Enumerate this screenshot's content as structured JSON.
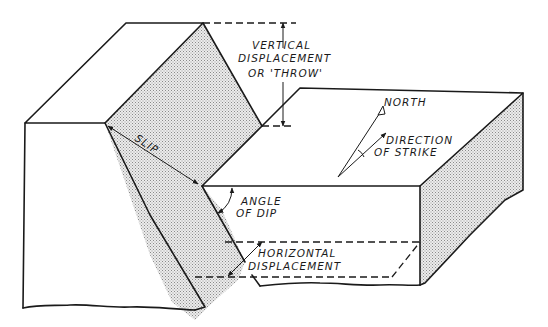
{
  "diagram": {
    "labels": {
      "vertical_displacement_line1": "VERTICAL",
      "vertical_displacement_line2": "DISPLACEMENT",
      "vertical_displacement_line3": "OR 'THROW'",
      "north": "NORTH",
      "direction_of_strike_line1": "DIRECTION",
      "direction_of_strike_line2": "OF STRIKE",
      "slip": "SLIP",
      "angle_of_dip_line1": "ANGLE",
      "angle_of_dip_line2": "OF DIP",
      "horizontal_displacement_line1": "HORIZONTAL",
      "horizontal_displacement_line2": "DISPLACEMENT"
    },
    "colors": {
      "line": "#1a1a1a",
      "stipple": "#9a9a9a",
      "background": "#ffffff"
    }
  }
}
